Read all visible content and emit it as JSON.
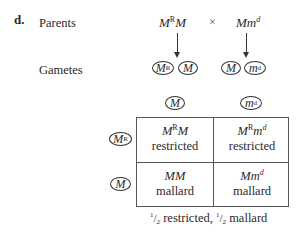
{
  "part_label": "d.",
  "rows": {
    "parents_label": "Parents",
    "gametes_label": "Gametes"
  },
  "cross": {
    "parent1": {
      "base1": "M",
      "sup1": "R",
      "base2": "M"
    },
    "symbol": "×",
    "parent2": {
      "base1": "M",
      "base2": "m",
      "sup2": "d"
    }
  },
  "gametes": {
    "parent1": [
      {
        "base": "M",
        "sup": "R"
      },
      {
        "base": "M",
        "sup": ""
      }
    ],
    "parent2": [
      {
        "base": "M",
        "sup": ""
      },
      {
        "base": "m",
        "sup": "d"
      }
    ]
  },
  "punnett": {
    "col_headers": [
      {
        "base": "M",
        "sup": ""
      },
      {
        "base": "m",
        "sup": "d"
      }
    ],
    "row_headers": [
      {
        "base": "M",
        "sup": "R"
      },
      {
        "base": "M",
        "sup": ""
      }
    ],
    "cells": [
      [
        {
          "genotype_a": "M",
          "genotype_a_sup": "R",
          "genotype_b": "M",
          "genotype_b_sup": "",
          "phenotype": "restricted"
        },
        {
          "genotype_a": "M",
          "genotype_a_sup": "R",
          "genotype_b": "m",
          "genotype_b_sup": "d",
          "phenotype": "restricted"
        }
      ],
      [
        {
          "genotype_a": "M",
          "genotype_a_sup": "",
          "genotype_b": "M",
          "genotype_b_sup": "",
          "phenotype": "mallard"
        },
        {
          "genotype_a": "M",
          "genotype_a_sup": "",
          "genotype_b": "m",
          "genotype_b_sup": "d",
          "phenotype": "mallard"
        }
      ]
    ]
  },
  "summary": {
    "frac1_num": "1",
    "frac1_den": "2",
    "pheno1": " restricted, ",
    "frac2_num": "1",
    "frac2_den": "2",
    "pheno2": " mallard"
  }
}
